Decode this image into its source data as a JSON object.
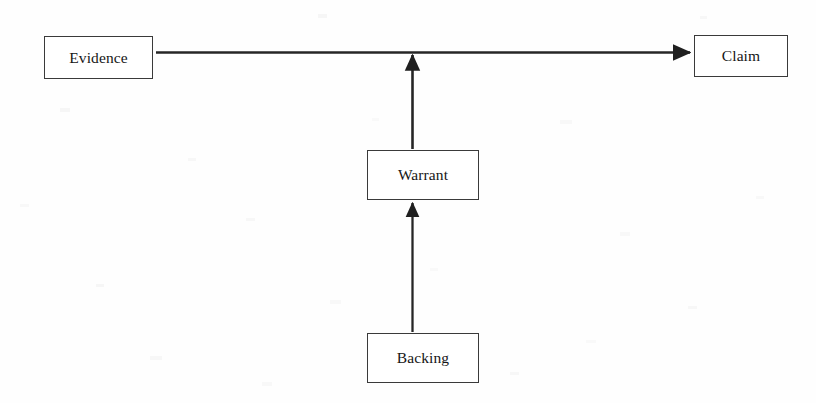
{
  "diagram": {
    "type": "flow-diagram",
    "background_color": "#fefefe",
    "stroke_color": "#262626",
    "text_color": "#161616",
    "nodes": [
      {
        "id": "evidence",
        "label": "Evidence",
        "x": 44,
        "y": 36,
        "width": 109,
        "height": 43
      },
      {
        "id": "claim",
        "label": "Claim",
        "x": 694,
        "y": 35,
        "width": 94,
        "height": 42
      },
      {
        "id": "warrant",
        "label": "Warrant",
        "x": 367,
        "y": 150,
        "width": 112,
        "height": 50
      },
      {
        "id": "backing",
        "label": "Backing",
        "x": 367,
        "y": 333,
        "width": 112,
        "height": 50
      }
    ],
    "edges": [
      {
        "id": "evidence-to-claim",
        "from": "evidence",
        "to": "claim",
        "orientation": "horizontal",
        "arrowhead": "end"
      },
      {
        "id": "warrant-to-link",
        "from": "warrant",
        "to": "evidence-to-claim",
        "orientation": "vertical-up",
        "arrowhead": "end"
      },
      {
        "id": "backing-to-warrant",
        "from": "backing",
        "to": "warrant",
        "orientation": "vertical-up",
        "arrowhead": "end"
      }
    ]
  }
}
